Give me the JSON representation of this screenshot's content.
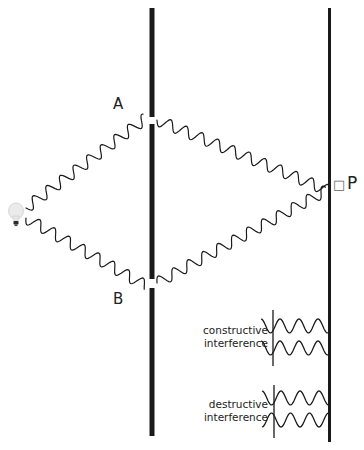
{
  "diagram": {
    "labels": {
      "slit_a": "A",
      "slit_b": "B",
      "point": "P",
      "point_marker": "□"
    },
    "interference": {
      "constructive": {
        "line1": "constructive",
        "line2": "interference",
        "phase_offset_deg": 0
      },
      "destructive": {
        "line1": "destructive",
        "line2": "interference",
        "phase_offset_deg": 180
      }
    },
    "elements": {
      "light_source": "light-bulb",
      "barrier": {
        "x": 152,
        "top": 8,
        "bottom": 436,
        "width": 5,
        "slits": [
          {
            "name": "A",
            "y": 120
          },
          {
            "name": "B",
            "y": 283
          }
        ]
      },
      "screen": {
        "x": 329,
        "top": 8,
        "bottom": 442,
        "width": 3
      }
    },
    "colors": {
      "ink": "#1a1a1a",
      "background": "#ffffff"
    }
  }
}
